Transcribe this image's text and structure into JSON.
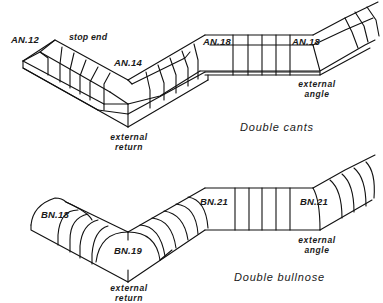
{
  "figures": [
    {
      "title": "Double cants",
      "labels": {
        "a": "AN.12",
        "stop_end": "stop end",
        "b": "AN.14",
        "c": "AN.18",
        "d": "AN.18",
        "ext_return_1": "external",
        "ext_return_2": "return",
        "ext_angle_1": "external",
        "ext_angle_2": "angle"
      }
    },
    {
      "title": "Double bullnose",
      "labels": {
        "a": "BN.18",
        "b": "BN.19",
        "c": "BN.21",
        "d": "BN.21",
        "ext_return_1": "external",
        "ext_return_2": "return",
        "ext_angle_1": "external",
        "ext_angle_2": "angle"
      }
    }
  ],
  "colors": {
    "line": "#111111",
    "background": "#ffffff"
  }
}
